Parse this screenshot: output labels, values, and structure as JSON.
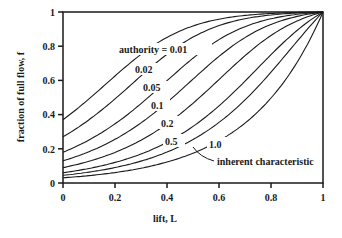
{
  "chart_data": {
    "type": "line",
    "title": "",
    "xlabel": "lift, L",
    "ylabel": "fraction of full flow, f",
    "xlim": [
      0,
      1
    ],
    "ylim": [
      0,
      1
    ],
    "xticks": [
      "0",
      "0.2",
      "0.4",
      "0.6",
      "0.8",
      "1"
    ],
    "yticks": [
      "0",
      "0.2",
      "0.4",
      "0.6",
      "0.8",
      "1"
    ],
    "grid": false,
    "legend": "inline labels",
    "annotations": [
      "authority = 0.01",
      "inherent characteristic"
    ],
    "series": [
      {
        "name": "authority = 0.01",
        "label": "0.01",
        "f_at_L0": 0.37,
        "x": [
          0,
          0.2,
          0.4,
          0.6,
          0.8,
          1
        ],
        "values": [
          0.37,
          0.52,
          0.68,
          0.82,
          0.93,
          1.0
        ]
      },
      {
        "name": "0.02",
        "label": "0.02",
        "f_at_L0": 0.27,
        "x": [
          0,
          0.2,
          0.4,
          0.6,
          0.8,
          1
        ],
        "values": [
          0.27,
          0.4,
          0.56,
          0.73,
          0.89,
          1.0
        ]
      },
      {
        "name": "0.05",
        "label": "0.05",
        "f_at_L0": 0.18,
        "x": [
          0,
          0.2,
          0.4,
          0.6,
          0.8,
          1
        ],
        "values": [
          0.18,
          0.28,
          0.42,
          0.6,
          0.81,
          1.0
        ]
      },
      {
        "name": "0.1",
        "label": "0.1",
        "f_at_L0": 0.13,
        "x": [
          0,
          0.2,
          0.4,
          0.6,
          0.8,
          1
        ],
        "values": [
          0.13,
          0.21,
          0.32,
          0.49,
          0.73,
          1.0
        ]
      },
      {
        "name": "0.2",
        "label": "0.2",
        "f_at_L0": 0.09,
        "x": [
          0,
          0.2,
          0.4,
          0.6,
          0.8,
          1
        ],
        "values": [
          0.09,
          0.15,
          0.24,
          0.39,
          0.63,
          1.0
        ]
      },
      {
        "name": "0.5",
        "label": "0.5",
        "f_at_L0": 0.06,
        "x": [
          0,
          0.2,
          0.4,
          0.6,
          0.8,
          1
        ],
        "values": [
          0.06,
          0.1,
          0.16,
          0.28,
          0.5,
          1.0
        ]
      },
      {
        "name": "1.0",
        "label": "1.0",
        "f_at_L0": 0.045,
        "x": [
          0,
          0.2,
          0.4,
          0.6,
          0.8,
          1
        ],
        "values": [
          0.045,
          0.07,
          0.12,
          0.21,
          0.41,
          1.0
        ]
      },
      {
        "name": "inherent characteristic",
        "label": "inherent characteristic",
        "f_at_L0": 0.03,
        "x": [
          0,
          0.2,
          0.4,
          0.6,
          0.8,
          1
        ],
        "values": [
          0.03,
          0.05,
          0.08,
          0.13,
          0.28,
          1.0
        ]
      }
    ]
  },
  "labels": {
    "ylabel": "fraction of full flow, f",
    "xlabel": "lift, L",
    "authority": "authority = 0.01",
    "l002": "0.02",
    "l005": "0.05",
    "l01": "0.1",
    "l02": "0.2",
    "l05": "0.5",
    "l10": "1.0",
    "inherent": "inherent characteristic",
    "x0": "0",
    "x02": "0.2",
    "x04": "0.4",
    "x06": "0.6",
    "x08": "0.8",
    "x1": "1",
    "y0": "0",
    "y02": "0.2",
    "y04": "0.4",
    "y06": "0.6",
    "y08": "0.8",
    "y1": "1"
  }
}
